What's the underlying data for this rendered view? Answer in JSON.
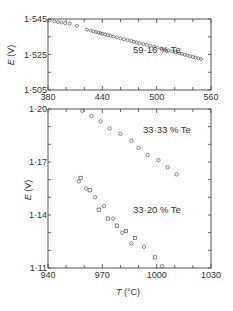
{
  "chart_data": [
    {
      "type": "scatter",
      "title": "",
      "annotation": "59·16 % Te",
      "xlabel": "",
      "ylabel": "E (V)",
      "xlim": [
        380,
        560
      ],
      "ylim": [
        1.505,
        1.545
      ],
      "xticks": [
        380,
        440,
        500,
        560
      ],
      "xtick_labels": [
        "380",
        "440",
        "500",
        "560"
      ],
      "yticks": [
        1.505,
        1.525,
        1.545
      ],
      "ytick_labels": [
        "1·505",
        "1·525",
        "1·545"
      ],
      "grid": false,
      "series": [
        {
          "name": "59·16 % Te",
          "marker": "circle-open",
          "x": [
            382,
            387,
            391,
            395,
            399,
            404,
            412,
            423,
            427,
            430,
            433,
            436,
            438,
            440,
            443,
            446,
            449,
            452,
            456,
            460,
            464,
            468,
            472,
            475,
            478,
            481,
            485,
            489,
            493,
            497,
            501,
            505,
            509,
            513,
            517,
            521,
            525,
            528,
            531,
            534,
            537,
            540,
            543,
            546,
            549
          ],
          "y": [
            1.5443,
            1.5437,
            1.5433,
            1.543,
            1.5427,
            1.5424,
            1.5412,
            1.539,
            1.5385,
            1.5381,
            1.5377,
            1.5373,
            1.537,
            1.5367,
            1.5363,
            1.5359,
            1.5355,
            1.5351,
            1.5346,
            1.5341,
            1.5336,
            1.5331,
            1.5326,
            1.5322,
            1.5318,
            1.5314,
            1.5309,
            1.5304,
            1.5299,
            1.5294,
            1.5289,
            1.5283,
            1.5278,
            1.5273,
            1.5268,
            1.5262,
            1.5257,
            1.5253,
            1.5249,
            1.5245,
            1.5241,
            1.5236,
            1.5232,
            1.5228,
            1.5224
          ]
        }
      ]
    },
    {
      "type": "scatter",
      "title": "",
      "annotations": [
        "33·33 % Te",
        "33·20 % Te"
      ],
      "xlabel": "T (°C)",
      "ylabel": "E (V)",
      "xlim": [
        940,
        1030
      ],
      "ylim": [
        1.11,
        1.2
      ],
      "xticks": [
        940,
        970,
        1000,
        1030
      ],
      "xtick_labels": [
        "940",
        "970",
        "1000",
        "1030"
      ],
      "yticks": [
        1.11,
        1.14,
        1.17,
        1.2
      ],
      "ytick_labels": [
        "1·11",
        "1·14",
        "1·17",
        "1·20"
      ],
      "grid": false,
      "series": [
        {
          "name": "33·33 % Te",
          "marker": "circle-open",
          "x": [
            959,
            964,
            969,
            974,
            980,
            986,
            990,
            995,
            1001,
            1006,
            1011
          ],
          "y": [
            1.199,
            1.196,
            1.193,
            1.189,
            1.186,
            1.182,
            1.178,
            1.174,
            1.171,
            1.167,
            1.163
          ]
        },
        {
          "name": "33·20 % Te",
          "marker": "mixed-open",
          "x": [
            957,
            958,
            961,
            963,
            966,
            968,
            971,
            973,
            976,
            978,
            981,
            983,
            986,
            988,
            993,
            999,
            1003
          ],
          "y": [
            1.159,
            1.161,
            1.155,
            1.154,
            1.15,
            1.143,
            1.145,
            1.138,
            1.138,
            1.134,
            1.13,
            1.131,
            1.124,
            1.127,
            1.122,
            1.116,
            1.111
          ]
        }
      ]
    }
  ],
  "labels": {
    "top_annotation": "59·16 % Te",
    "top_ylabel_italic": "E",
    "top_ylabel_unit": " (V)",
    "bottom_annotation_1": "33·33 % Te",
    "bottom_annotation_2": "33·20 % Te",
    "bottom_ylabel_italic": "E",
    "bottom_ylabel_unit": " (V)",
    "xlabel_italic": "T",
    "xlabel_unit": " (°C)"
  }
}
